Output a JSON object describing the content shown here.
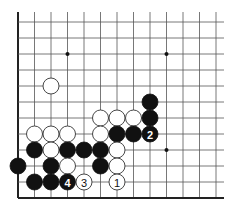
{
  "board": {
    "cols": 13,
    "rows": 12,
    "origin_x": 18,
    "origin_y": 22,
    "spacing_x": 16.5,
    "spacing_y": 16,
    "line_top": 12,
    "line_right": 224,
    "edges": [
      "left",
      "bottom"
    ],
    "stone_radius": 8,
    "colors": {
      "black": "#111111",
      "white": "#ffffff",
      "line": "#555555"
    }
  },
  "star_points": [
    {
      "col": 3,
      "row": 2
    },
    {
      "col": 9,
      "row": 2
    },
    {
      "col": 9,
      "row": 8
    }
  ],
  "stones": [
    {
      "color": "white",
      "col": 2,
      "row": 4,
      "label": ""
    },
    {
      "color": "black",
      "col": 8,
      "row": 5,
      "label": ""
    },
    {
      "color": "white",
      "col": 5,
      "row": 6,
      "label": ""
    },
    {
      "color": "white",
      "col": 6,
      "row": 6,
      "label": ""
    },
    {
      "color": "white",
      "col": 7,
      "row": 6,
      "label": ""
    },
    {
      "color": "black",
      "col": 8,
      "row": 6,
      "label": ""
    },
    {
      "color": "white",
      "col": 1,
      "row": 7,
      "label": ""
    },
    {
      "color": "white",
      "col": 2,
      "row": 7,
      "label": ""
    },
    {
      "color": "white",
      "col": 3,
      "row": 7,
      "label": ""
    },
    {
      "color": "white",
      "col": 5,
      "row": 7,
      "label": ""
    },
    {
      "color": "black",
      "col": 6,
      "row": 7,
      "label": ""
    },
    {
      "color": "black",
      "col": 7,
      "row": 7,
      "label": ""
    },
    {
      "color": "black",
      "col": 8,
      "row": 7,
      "label": "2"
    },
    {
      "color": "black",
      "col": 1,
      "row": 8,
      "label": ""
    },
    {
      "color": "white",
      "col": 2,
      "row": 8,
      "label": ""
    },
    {
      "color": "black",
      "col": 3,
      "row": 8,
      "label": ""
    },
    {
      "color": "black",
      "col": 4,
      "row": 8,
      "label": ""
    },
    {
      "color": "black",
      "col": 5,
      "row": 8,
      "label": ""
    },
    {
      "color": "white",
      "col": 6,
      "row": 8,
      "label": ""
    },
    {
      "color": "black",
      "col": 0,
      "row": 9,
      "label": ""
    },
    {
      "color": "black",
      "col": 2,
      "row": 9,
      "label": ""
    },
    {
      "color": "white",
      "col": 3,
      "row": 9,
      "label": ""
    },
    {
      "color": "black",
      "col": 5,
      "row": 9,
      "label": ""
    },
    {
      "color": "white",
      "col": 6,
      "row": 9,
      "label": ""
    },
    {
      "color": "black",
      "col": 1,
      "row": 10,
      "label": ""
    },
    {
      "color": "black",
      "col": 2,
      "row": 10,
      "label": ""
    },
    {
      "color": "black",
      "col": 3,
      "row": 10,
      "label": "4"
    },
    {
      "color": "white",
      "col": 4,
      "row": 10,
      "label": "3"
    },
    {
      "color": "white",
      "col": 6,
      "row": 10,
      "label": "1"
    }
  ]
}
